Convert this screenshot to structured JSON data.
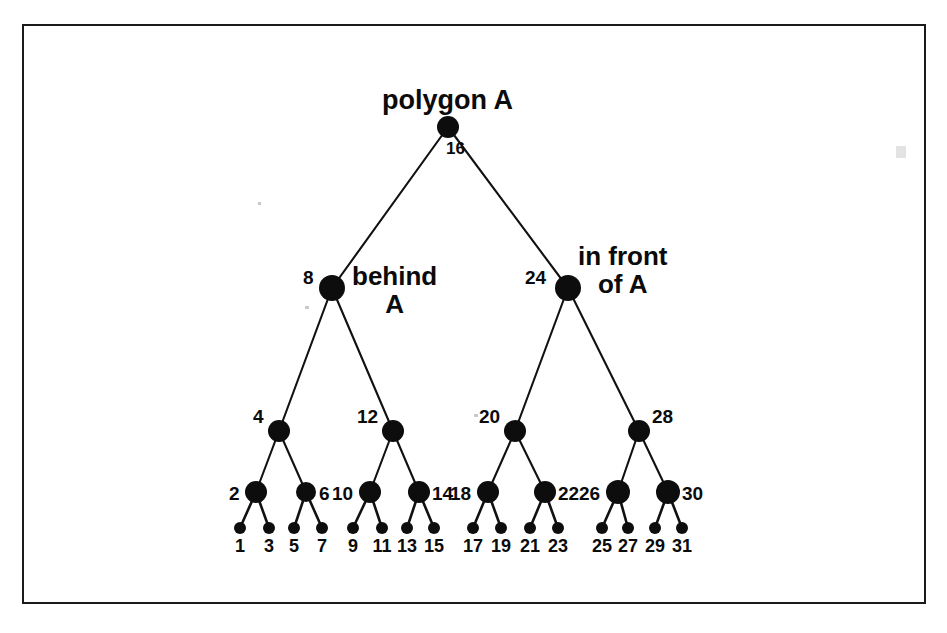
{
  "figure": {
    "background_color": "#ffffff",
    "frame_color": "#1a1a1a",
    "node_color": "#0d0d0d",
    "edge_color": "#111111",
    "text_color": "#0b0b0b"
  },
  "captions": {
    "root": "polygon A",
    "left_subtree": "behind\nA",
    "right_subtree": "in front\nof A"
  },
  "tree": {
    "type": "binary-tree",
    "depth": 5,
    "root_label": "16",
    "levels": [
      {
        "level": 1,
        "y": 127,
        "nodes": [
          {
            "label": "16",
            "x": 448,
            "r": 11,
            "label_dx": -2,
            "label_dy": 13,
            "label_align": "center"
          }
        ]
      },
      {
        "level": 2,
        "y": 288,
        "nodes": [
          {
            "label": "8",
            "x": 332,
            "r": 13,
            "label_dx": -29,
            "label_dy": -20,
            "label_align": "left"
          },
          {
            "label": "24",
            "x": 568,
            "r": 13,
            "label_dx": -43,
            "label_dy": -20,
            "label_align": "left"
          }
        ]
      },
      {
        "level": 3,
        "y": 431,
        "nodes": [
          {
            "label": "4",
            "x": 279,
            "r": 11,
            "label_dx": -26,
            "label_dy": -24,
            "label_align": "left"
          },
          {
            "label": "12",
            "x": 393,
            "r": 11,
            "label_dx": -36,
            "label_dy": -24,
            "label_align": "left"
          },
          {
            "label": "20",
            "x": 515,
            "r": 11,
            "label_dx": -36,
            "label_dy": -24,
            "label_align": "left"
          },
          {
            "label": "28",
            "x": 639,
            "r": 11,
            "label_dx": 13,
            "label_dy": -24,
            "label_align": "left"
          }
        ]
      },
      {
        "level": 4,
        "y": 492,
        "nodes": [
          {
            "label": "2",
            "x": 256,
            "r": 11,
            "label_dx": -27,
            "label_dy": -8,
            "label_align": "left"
          },
          {
            "label": "6",
            "x": 306,
            "r": 10,
            "label_dx": 13,
            "label_dy": -8,
            "label_align": "left"
          },
          {
            "label": "10",
            "x": 370,
            "r": 11,
            "label_dx": -38,
            "label_dy": -8,
            "label_align": "left"
          },
          {
            "label": "14",
            "x": 419,
            "r": 11,
            "label_dx": 13,
            "label_dy": -8,
            "label_align": "left"
          },
          {
            "label": "18",
            "x": 488,
            "r": 11,
            "label_dx": -38,
            "label_dy": -8,
            "label_align": "left"
          },
          {
            "label": "22",
            "x": 545,
            "r": 11,
            "label_dx": 13,
            "label_dy": -8,
            "label_align": "left"
          },
          {
            "label": "26",
            "x": 618,
            "r": 12,
            "label_dx": -39,
            "label_dy": -8,
            "label_align": "left"
          },
          {
            "label": "30",
            "x": 668,
            "r": 12,
            "label_dx": 14,
            "label_dy": -8,
            "label_align": "left"
          }
        ]
      },
      {
        "level": 5,
        "y": 528,
        "nodes": [
          {
            "label": "1",
            "x": 240,
            "r": 6
          },
          {
            "label": "3",
            "x": 269,
            "r": 6
          },
          {
            "label": "5",
            "x": 294,
            "r": 6
          },
          {
            "label": "7",
            "x": 322,
            "r": 6
          },
          {
            "label": "9",
            "x": 353,
            "r": 6
          },
          {
            "label": "11",
            "x": 382,
            "r": 6
          },
          {
            "label": "13",
            "x": 407,
            "r": 6
          },
          {
            "label": "15",
            "x": 434,
            "r": 6
          },
          {
            "label": "17",
            "x": 473,
            "r": 6
          },
          {
            "label": "19",
            "x": 501,
            "r": 6
          },
          {
            "label": "21",
            "x": 530,
            "r": 6
          },
          {
            "label": "23",
            "x": 558,
            "r": 6
          },
          {
            "label": "25",
            "x": 602,
            "r": 6
          },
          {
            "label": "27",
            "x": 628,
            "r": 6
          },
          {
            "label": "29",
            "x": 655,
            "r": 6
          },
          {
            "label": "31",
            "x": 682,
            "r": 6
          }
        ]
      }
    ],
    "edges": [
      {
        "from": [
          448,
          127
        ],
        "to": [
          332,
          288
        ]
      },
      {
        "from": [
          448,
          127
        ],
        "to": [
          568,
          288
        ]
      },
      {
        "from": [
          332,
          288
        ],
        "to": [
          279,
          431
        ]
      },
      {
        "from": [
          332,
          288
        ],
        "to": [
          393,
          431
        ]
      },
      {
        "from": [
          568,
          288
        ],
        "to": [
          515,
          431
        ]
      },
      {
        "from": [
          568,
          288
        ],
        "to": [
          639,
          431
        ]
      },
      {
        "from": [
          279,
          431
        ],
        "to": [
          256,
          492
        ]
      },
      {
        "from": [
          279,
          431
        ],
        "to": [
          306,
          492
        ]
      },
      {
        "from": [
          393,
          431
        ],
        "to": [
          370,
          492
        ]
      },
      {
        "from": [
          393,
          431
        ],
        "to": [
          419,
          492
        ]
      },
      {
        "from": [
          515,
          431
        ],
        "to": [
          488,
          492
        ]
      },
      {
        "from": [
          515,
          431
        ],
        "to": [
          545,
          492
        ]
      },
      {
        "from": [
          639,
          431
        ],
        "to": [
          618,
          492
        ]
      },
      {
        "from": [
          639,
          431
        ],
        "to": [
          668,
          492
        ]
      }
    ],
    "leaf_edges": [
      {
        "from": [
          256,
          492
        ],
        "to": [
          240,
          528
        ]
      },
      {
        "from": [
          256,
          492
        ],
        "to": [
          269,
          528
        ]
      },
      {
        "from": [
          306,
          492
        ],
        "to": [
          294,
          528
        ]
      },
      {
        "from": [
          306,
          492
        ],
        "to": [
          322,
          528
        ]
      },
      {
        "from": [
          370,
          492
        ],
        "to": [
          353,
          528
        ]
      },
      {
        "from": [
          370,
          492
        ],
        "to": [
          382,
          528
        ]
      },
      {
        "from": [
          419,
          492
        ],
        "to": [
          407,
          528
        ]
      },
      {
        "from": [
          419,
          492
        ],
        "to": [
          434,
          528
        ]
      },
      {
        "from": [
          488,
          492
        ],
        "to": [
          473,
          528
        ]
      },
      {
        "from": [
          488,
          492
        ],
        "to": [
          501,
          528
        ]
      },
      {
        "from": [
          545,
          492
        ],
        "to": [
          530,
          528
        ]
      },
      {
        "from": [
          545,
          492
        ],
        "to": [
          558,
          528
        ]
      },
      {
        "from": [
          618,
          492
        ],
        "to": [
          602,
          528
        ]
      },
      {
        "from": [
          618,
          492
        ],
        "to": [
          628,
          528
        ]
      },
      {
        "from": [
          668,
          492
        ],
        "to": [
          655,
          528
        ]
      },
      {
        "from": [
          668,
          492
        ],
        "to": [
          682,
          528
        ]
      }
    ],
    "leaf_label_y": 537
  }
}
